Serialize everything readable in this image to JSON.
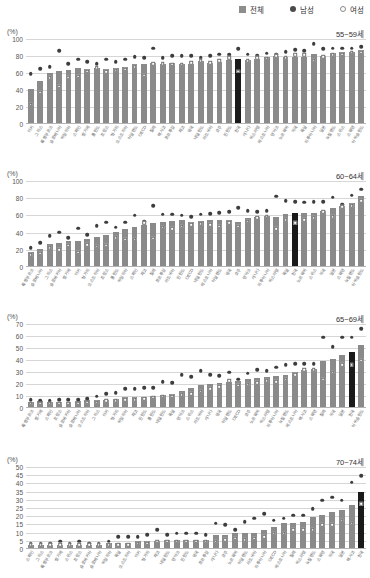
{
  "legend": {
    "items": [
      {
        "label": "전체",
        "marker": "square-gray-icon",
        "color": "#8d8d8d"
      },
      {
        "label": "남성",
        "marker": "filled-circle-icon",
        "color": "#4a4a4a"
      },
      {
        "label": "여성",
        "marker": "open-circle-icon",
        "color": "#ffffff"
      }
    ]
  },
  "colors": {
    "bar": "#8a8a8a",
    "bar_highlight": "#1a1a1a",
    "male_dot": "#3d3d3d",
    "female_dot": "#ffffff",
    "gridline": "#d6d6d6",
    "axis": "#b4b4b4"
  },
  "unit_label": "(%)",
  "highlight_country": "한국",
  "chart_data": [
    {
      "type": "bar",
      "title": "55~59세",
      "xlabel": "",
      "ylabel": "(%)",
      "ylim": [
        0,
        100
      ],
      "yticks": [
        0,
        20,
        40,
        60,
        80,
        100
      ],
      "grid": true,
      "legend_position": "top-right",
      "categories": [
        "터키",
        "그리스",
        "룩셈부르크",
        "슬로베니아",
        "이탈리아",
        "스페인",
        "벨기에",
        "폴란드",
        "프랑스",
        "헝가리",
        "오스트리아",
        "아일랜드",
        "OECD",
        "칠레",
        "멕시코",
        "포르투갈",
        "체코",
        "영국",
        "네덜란드",
        "라트비아",
        "호주",
        "핀란드",
        "한국",
        "캐나다",
        "이스라엘",
        "에스토니아",
        "덴마크",
        "노르웨이",
        "미국",
        "독일",
        "리투아니아",
        "일본",
        "뉴질랜드",
        "스위스",
        "스웨덴",
        "아이슬란드"
      ],
      "series": [
        {
          "name": "전체",
          "values": [
            40,
            49,
            59,
            61,
            62,
            65,
            64,
            65,
            64,
            65,
            66,
            70,
            70,
            71,
            70,
            71,
            70,
            70,
            73,
            71,
            72,
            74,
            75,
            74,
            75,
            78,
            79,
            78,
            78,
            78,
            81,
            79,
            82,
            83,
            84,
            86
          ]
        },
        {
          "name": "남성",
          "values": [
            58,
            64,
            66,
            85,
            70,
            75,
            72,
            70,
            75,
            72,
            75,
            78,
            77,
            88,
            77,
            79,
            79,
            79,
            77,
            79,
            81,
            80,
            87,
            81,
            79,
            82,
            81,
            84,
            86,
            85,
            93,
            87,
            88,
            88,
            88,
            90
          ]
        },
        {
          "name": "여성",
          "values": [
            22,
            36,
            53,
            43,
            54,
            55,
            61,
            65,
            60,
            62,
            63,
            66,
            56,
            70,
            70,
            69,
            69,
            71,
            73,
            71,
            73,
            77,
            61,
            73,
            77,
            76,
            79,
            77,
            80,
            80,
            74,
            78,
            80,
            81,
            83,
            83
          ]
        }
      ]
    },
    {
      "type": "bar",
      "title": "60~64세",
      "xlabel": "",
      "ylabel": "(%)",
      "ylim": [
        0,
        100
      ],
      "yticks": [
        0,
        20,
        40,
        60,
        80,
        100
      ],
      "grid": true,
      "legend_position": "top-right",
      "categories": [
        "룩셈부르크",
        "슬로베니아",
        "그리스",
        "슬로바키아",
        "벨기에",
        "터키",
        "헝가리",
        "오스트리아",
        "프랑스",
        "폴란드",
        "이탈리아",
        "스페인",
        "체코",
        "칠레",
        "포르투갈",
        "라트비아",
        "핀란드",
        "OECD",
        "네덜란드",
        "에스토니아",
        "아일랜드",
        "영국",
        "호주",
        "덴마크",
        "캐나다",
        "리투아니아",
        "이스라엘",
        "독일",
        "한국",
        "노르웨이",
        "스위스",
        "미국",
        "일본",
        "스웨덴",
        "뉴질랜드",
        "아이슬란드"
      ],
      "series": [
        {
          "name": "전체",
          "values": [
            16,
            20,
            26,
            27,
            29,
            29,
            31,
            34,
            36,
            40,
            43,
            45,
            48,
            50,
            51,
            52,
            53,
            51,
            52,
            53,
            54,
            54,
            51,
            56,
            57,
            58,
            57,
            61,
            62,
            62,
            62,
            64,
            68,
            70,
            73,
            81
          ]
        },
        {
          "name": "남성",
          "values": [
            21,
            27,
            35,
            39,
            33,
            44,
            36,
            47,
            51,
            45,
            51,
            59,
            52,
            70,
            60,
            60,
            59,
            57,
            60,
            61,
            62,
            63,
            68,
            64,
            63,
            64,
            81,
            76,
            75,
            74,
            75,
            75,
            80,
            72,
            82,
            89
          ]
        },
        {
          "name": "여성",
          "values": [
            13,
            15,
            21,
            19,
            24,
            16,
            25,
            23,
            24,
            33,
            31,
            31,
            50,
            32,
            45,
            43,
            46,
            48,
            49,
            48,
            46,
            50,
            46,
            52,
            56,
            58,
            43,
            54,
            50,
            54,
            56,
            63,
            57,
            69,
            70,
            76
          ]
        }
      ]
    },
    {
      "type": "bar",
      "title": "65~69세",
      "xlabel": "",
      "ylabel": "(%)",
      "ylim": [
        0,
        70
      ],
      "yticks": [
        0,
        10,
        20,
        30,
        40,
        50,
        60,
        70
      ],
      "grid": true,
      "legend_position": "top-right",
      "categories": [
        "룩셈부르크",
        "벨기에",
        "스페인",
        "프랑스",
        "슬로바키아",
        "슬로베니아",
        "오스트리아",
        "그리스",
        "터키",
        "헝가리",
        "이탈리아",
        "체코",
        "핀란드",
        "폴란드",
        "네덜란드",
        "독일",
        "덴마크",
        "스위스",
        "라트비아",
        "캐나다",
        "영국",
        "아일랜드",
        "OECD",
        "호주",
        "노르웨이",
        "이스라엘",
        "리투아니아",
        "뉴질랜드",
        "에스토니아",
        "멕시코",
        "스웨덴",
        "칠레",
        "미국",
        "일본",
        "한국",
        "아이슬란드"
      ],
      "series": [
        {
          "name": "전체",
          "values": [
            4,
            5,
            4,
            4,
            4,
            5,
            6,
            6,
            6,
            7,
            8,
            8,
            8,
            9,
            10,
            11,
            13,
            16,
            18,
            19,
            20,
            21,
            22,
            23,
            24,
            25,
            26,
            27,
            29,
            31,
            32,
            38,
            40,
            43,
            46,
            52
          ]
        },
        {
          "name": "남성",
          "values": [
            6,
            5,
            5,
            6,
            6,
            6,
            7,
            9,
            11,
            12,
            15,
            15,
            16,
            16,
            21,
            20,
            27,
            25,
            30,
            27,
            26,
            29,
            23,
            28,
            31,
            30,
            33,
            35,
            36,
            36,
            36,
            58,
            50,
            58,
            58,
            65
          ]
        },
        {
          "name": "여성",
          "values": [
            3,
            3,
            3,
            3,
            3,
            3,
            4,
            4,
            5,
            5,
            6,
            6,
            7,
            8,
            9,
            9,
            10,
            11,
            13,
            15,
            17,
            22,
            18,
            19,
            20,
            22,
            21,
            23,
            27,
            31,
            31,
            23,
            29,
            35,
            35,
            39
          ]
        }
      ]
    },
    {
      "type": "bar",
      "title": "70~74세",
      "xlabel": "",
      "ylabel": "(%)",
      "ylim": [
        0,
        50
      ],
      "yticks": [
        0,
        5,
        10,
        15,
        20,
        25,
        30,
        35,
        40,
        45,
        50
      ],
      "grid": true,
      "legend_position": "top-right",
      "categories": [
        "스페인",
        "그리스",
        "룩셈부르크",
        "벨기에",
        "스위스",
        "프랑스",
        "슬로바키아",
        "슬로베니아",
        "이탈리아",
        "독일",
        "오스트리아",
        "터키",
        "헝가리",
        "체코",
        "네덜란드",
        "덴마크",
        "핀란드",
        "영국",
        "포르투갈",
        "캐나다",
        "호주",
        "노르웨이",
        "아일랜드",
        "라트비아",
        "리투아니아",
        "OECD",
        "에스토니아",
        "칠레",
        "이스라엘",
        "뉴질랜드",
        "스웨덴",
        "미국",
        "일본",
        "멕시코",
        "한국"
      ],
      "series": [
        {
          "name": "전체",
          "values": [
            2,
            2,
            2,
            2,
            2,
            2,
            2,
            2,
            3,
            3,
            3,
            4,
            4,
            4,
            5,
            5,
            5,
            5,
            5,
            8,
            8,
            9,
            9,
            9,
            11,
            13,
            15,
            15,
            16,
            19,
            20,
            22,
            23,
            26,
            34
          ]
        },
        {
          "name": "남성",
          "values": [
            3,
            3,
            3,
            4,
            3,
            4,
            3,
            3,
            4,
            7,
            7,
            7,
            8,
            11,
            8,
            9,
            9,
            9,
            8,
            15,
            14,
            11,
            16,
            18,
            21,
            17,
            18,
            20,
            20,
            24,
            29,
            31,
            29,
            40,
            44
          ]
        },
        {
          "name": "여성",
          "values": [
            2,
            2,
            2,
            2,
            2,
            2,
            2,
            2,
            2,
            2,
            2,
            3,
            3,
            4,
            4,
            4,
            4,
            4,
            4,
            4,
            5,
            6,
            5,
            6,
            7,
            9,
            9,
            11,
            11,
            11,
            14,
            14,
            17,
            15,
            27
          ]
        }
      ]
    }
  ]
}
